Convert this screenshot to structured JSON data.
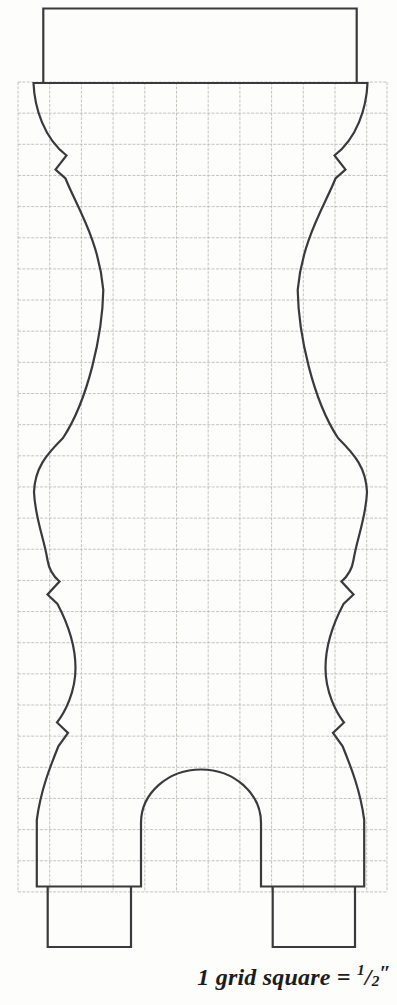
{
  "pattern": {
    "caption": {
      "prefix": "1 grid square = ",
      "numerator": "1",
      "slash": "/",
      "denominator": "2",
      "unit_mark": "″",
      "full_text": "1 grid square = 1/2\""
    },
    "colors": {
      "outline": "#3a3a3e",
      "grid": "#b9beb4",
      "caption": "#1c1c1c",
      "page_background": "#fdfdfc"
    },
    "grid": {
      "square_equals": "1/2 inch",
      "vertical_xs": [
        18,
        49.7,
        81.4,
        113.1,
        144.8,
        176.5,
        208.2,
        239.9,
        271.6,
        303.3,
        335,
        366.7,
        387
      ],
      "y_top": 82,
      "y_bottom": 892,
      "horizontal_y_start": 82,
      "horizontal_step": 31.15,
      "horizontal_count": 27,
      "x_left": 18,
      "x_right": 387,
      "dash": "3 1.4"
    },
    "geometry": {
      "outline_path": "M 33.5 83 C 34.5 108 44 138 66.5 155.5 L 55.5 169.5 L 65.5 178.5 C 76 205 99 240 103.3 290 C 102.5 335 88 400 63 438 C 46 455 35 468 34 492 C 35 518 44 538 47.5 560 Q 49.5 573 59.5 581.5 L 47.5 594.5 L 57.5 604 C 67 622 75.5 645 75.5 668 C 75.5 692 65 712 57 722.5 L 68 733 L 58.5 746 C 50 767 40.5 791 36.8 820 L 36.8 886.5 L 141 886.5 L 141 823 A 60 53.5 0 0 1 261 823 L 261 886.5 L 364.2 886.5 L 364.2 820 C 360.5 791 351 767 342.5 746 L 333 733 L 344 722.5 C 336 712 325.5 692 325.5 668 C 325.5 645 334 622 343.5 604 L 353.5 594.5 L 341.5 581.5 Q 351.5 573 353.5 560 C 357 538 366 518 367 492 C 366 468 355 455 338 438 C 313 400 298.5 335 297.7 290 C 302 240 325 205 335.5 178.5 L 345.5 169.5 L 334.5 155.5 C 357 138 366.5 108 367.5 83 Z",
      "tenon_path": "M 43.3 83 L 43.3 8.5 L 356.7 8.5 L 356.7 83",
      "left_foot_path": "M 47.7 886.5 L 47.7 947 L 131 947 L 131 886.5",
      "right_foot_path": "M 272.7 886.5 L 272.7 947 L 355 947 L 355 886.5"
    }
  }
}
